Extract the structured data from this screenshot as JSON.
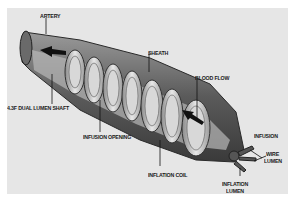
{
  "figure": {
    "background": "#e6e6e6",
    "labels": {
      "artery": "ARTERY",
      "sheath": "SHEATH",
      "blood_flow": "BLOOD FLOW",
      "shaft": "4.3F DUAL LUMEN SHAFT",
      "infusion_opening": "INFUSION OPENING",
      "infusion": "INFUSION",
      "wire_lumen_1": "WIRE",
      "wire_lumen_2": "LUMEN",
      "inflation_coil": "INFLATION COIL",
      "inflation_lumen_1": "INFLATION",
      "inflation_lumen_2": "LUMEN"
    }
  }
}
